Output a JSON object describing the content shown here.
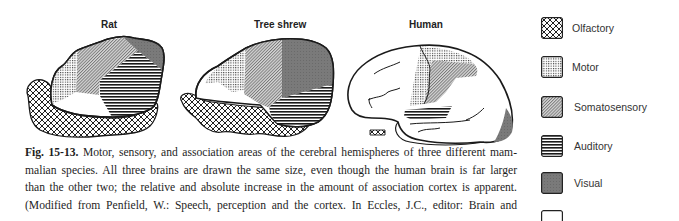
{
  "figure": {
    "panels": [
      {
        "title": "Rat"
      },
      {
        "title": "Tree shrew"
      },
      {
        "title": "Human"
      }
    ]
  },
  "caption": {
    "fig_number": "Fig. 15-13.",
    "lines": [
      " Motor, sensory, and association areas of the cerebral hemispheres of three different mam-",
      "malian species. All three brains are drawn the same size, even though the human brain is far larger",
      "than the other two; the relative and absolute increase in the amount of association cortex is apparent.",
      "(Modified from Penfield, W.: Speech, perception and the cortex. In Eccles, J.C., editor: Brain and"
    ]
  },
  "legend": {
    "items": [
      {
        "label": "Olfactory",
        "pattern": "crosshatch"
      },
      {
        "label": "Motor",
        "pattern": "dots"
      },
      {
        "label": "Somatosensory",
        "pattern": "diagonal"
      },
      {
        "label": "Auditory",
        "pattern": "horizontal-lines"
      },
      {
        "label": "Visual",
        "pattern": "dark-gray"
      },
      {
        "label": "",
        "pattern": "blank"
      }
    ]
  },
  "colors": {
    "outline": "#1a1a1a",
    "visual": "#7a7a7a",
    "somatosensory": "#bdbdbd",
    "background": "#ffffff"
  }
}
